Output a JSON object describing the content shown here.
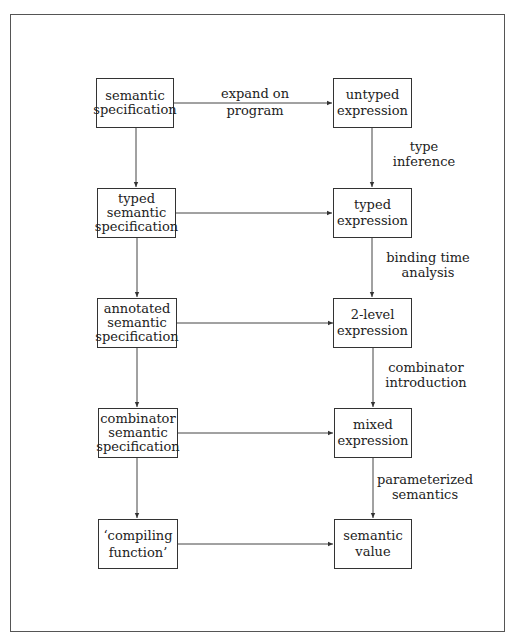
{
  "left_column": [
    {
      "label": "semantic\nspecification"
    },
    {
      "label": "typed\nsemantic\nspecification"
    },
    {
      "label": "annotated\nsemantic\nspecification"
    },
    {
      "label": "combinator\nsemantic\nspecification"
    },
    {
      "label": "‘compiling\nfunction’"
    }
  ],
  "right_column": [
    {
      "label": "untyped\nexpression"
    },
    {
      "label": "typed\nexpression"
    },
    {
      "label": "2-level\nexpression"
    },
    {
      "label": "mixed\nexpression"
    },
    {
      "label": "semantic\nvalue"
    }
  ],
  "horizontal_edges": [
    {
      "label": "expand on\nprogram"
    },
    {
      "label": ""
    },
    {
      "label": ""
    },
    {
      "label": ""
    },
    {
      "label": ""
    }
  ],
  "right_vertical_edges": [
    {
      "label": "type\ninference"
    },
    {
      "label": "binding time\nanalysis"
    },
    {
      "label": "combinator\nintroduction"
    },
    {
      "label": "parameterized\nsemantics"
    }
  ]
}
